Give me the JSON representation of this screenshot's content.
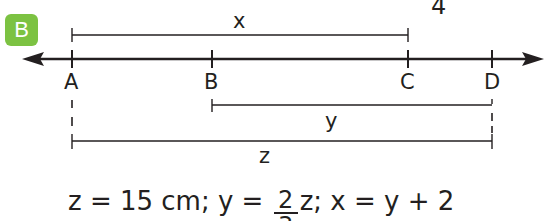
{
  "page_number": "4",
  "badge": {
    "label": "B",
    "color": "#7cc242"
  },
  "line": {
    "points": [
      {
        "label": "A",
        "x": 72
      },
      {
        "label": "B",
        "x": 212
      },
      {
        "label": "C",
        "x": 408
      },
      {
        "label": "D",
        "x": 492
      }
    ]
  },
  "segments": {
    "x": {
      "label": "x",
      "from": "A",
      "to": "C"
    },
    "y": {
      "label": "y",
      "from": "B",
      "to": "D"
    },
    "z": {
      "label": "z",
      "from": "A",
      "to": "D"
    }
  },
  "formula": {
    "part1": "z = 15 cm; y = ",
    "frac_num": "2",
    "frac_den": "3",
    "part2": "z; x = y + 2"
  },
  "colors": {
    "ink": "#231f20",
    "badge": "#7cc242"
  }
}
